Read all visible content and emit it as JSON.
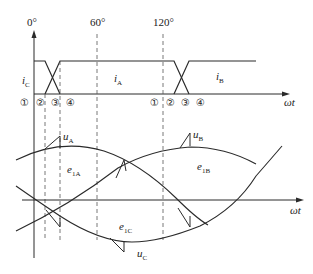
{
  "angle_labels": {
    "deg0": "0°",
    "deg60": "60°",
    "deg120": "120°"
  },
  "axis": {
    "upper_x_label": "ωt",
    "lower_x_label": "ωt"
  },
  "current_labels": {
    "ic": "i",
    "ic_sub": "C",
    "ia": "i",
    "ia_sub": "A",
    "ib": "i",
    "ib_sub": "B"
  },
  "interval_markers": {
    "first_group": [
      "①",
      "②",
      "③",
      "④"
    ],
    "second_group": [
      "①",
      "②",
      "③",
      "④"
    ]
  },
  "waveform_labels": {
    "ua": "u",
    "ua_sub": "A",
    "ub": "u",
    "ub_sub": "B",
    "uc": "u",
    "uc_sub": "C",
    "e1a": "e",
    "e1a_sub": "1A",
    "e1b": "e",
    "e1b_sub": "1B",
    "e1c": "e",
    "e1c_sub": "1C"
  },
  "colors": {
    "line": "#2a2a2a",
    "dashed": "#555555",
    "background": "#ffffff"
  }
}
